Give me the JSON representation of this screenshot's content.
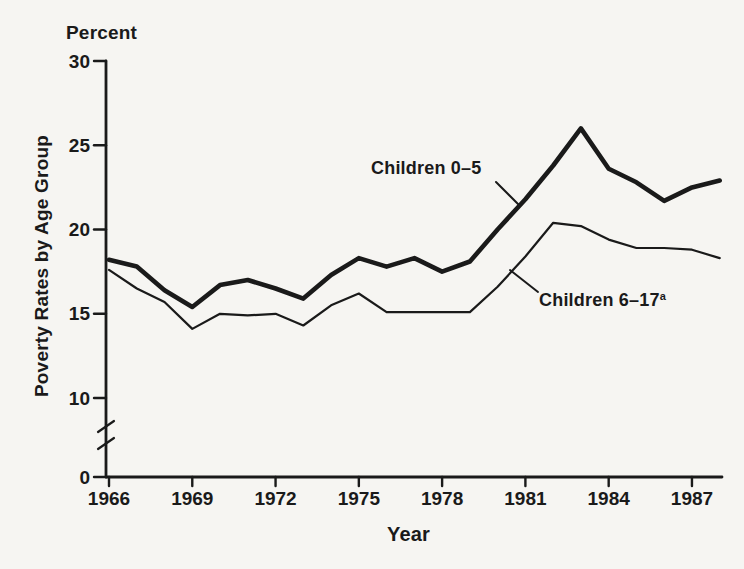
{
  "figure": {
    "unit_label": "Percent",
    "y_axis_title": "Poverty Rates by Age Group",
    "x_axis_title": "Year",
    "background_color": "#f6f5f2",
    "line_color": "#1a1a1a"
  },
  "chart_data": {
    "type": "line",
    "title": "",
    "xlabel": "Year",
    "ylabel": "Poverty Rates by Age Group",
    "unit": "Percent",
    "x": [
      1966,
      1967,
      1968,
      1969,
      1970,
      1971,
      1972,
      1973,
      1974,
      1975,
      1976,
      1977,
      1978,
      1979,
      1980,
      1981,
      1982,
      1983,
      1984,
      1985,
      1986,
      1987,
      1988
    ],
    "series": [
      {
        "name": "Children 0-5",
        "label": "Children 0–5",
        "style": "thick",
        "values": [
          18.2,
          17.8,
          16.4,
          15.4,
          16.7,
          17.0,
          16.5,
          15.9,
          17.3,
          18.3,
          17.8,
          18.3,
          17.5,
          18.1,
          20.0,
          21.8,
          23.8,
          26.0,
          23.6,
          22.8,
          21.7,
          22.5,
          22.9
        ]
      },
      {
        "name": "Children 6-17",
        "label": "Children 6–17",
        "label_sup": "a",
        "style": "thin",
        "values": [
          17.6,
          16.5,
          15.7,
          14.1,
          15.0,
          14.9,
          15.0,
          14.3,
          15.5,
          16.2,
          15.1,
          15.1,
          15.1,
          15.1,
          16.6,
          18.4,
          20.4,
          20.2,
          19.4,
          18.9,
          18.9,
          18.8,
          18.3
        ]
      }
    ],
    "x_tick_labels": [
      "1966",
      "1969",
      "1972",
      "1975",
      "1978",
      "1981",
      "1984",
      "1987"
    ],
    "y_tick_labels": [
      "0",
      "10",
      "15",
      "20",
      "25",
      "30"
    ],
    "ylim": [
      0,
      30
    ],
    "xlim": [
      1966,
      1988
    ],
    "axis_break_between": [
      0,
      10
    ],
    "grid": false,
    "legend_position": "inline-annotations",
    "annotations": [
      {
        "text": "Children 0–5",
        "sup": ""
      },
      {
        "text": "Children 6–17",
        "sup": "a"
      }
    ]
  }
}
